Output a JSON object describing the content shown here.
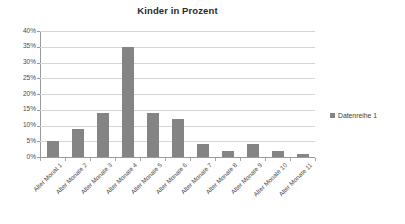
{
  "chart_data": {
    "type": "bar",
    "title": "Kinder in Prozent",
    "xlabel": "",
    "ylabel": "",
    "ylim": [
      0,
      40
    ],
    "ytick_step": 5,
    "ytick_labels": [
      "40%",
      "35%",
      "30%",
      "25%",
      "20%",
      "15%",
      "10%",
      "5%",
      "0%"
    ],
    "ytick_values": [
      40,
      35,
      30,
      25,
      20,
      15,
      10,
      5,
      0
    ],
    "grid": true,
    "legend_position": "right",
    "categories": [
      "Alter Monat 1",
      "Alter Monate 2",
      "Alter Monate 3",
      "Alter Monate 4",
      "Alter Monate 5",
      "Alter Monate 6",
      "Alter Monate 7",
      "Alter Monate 8",
      "Alter Monate 9",
      "Alter Monate 10",
      "Alter Monate 11"
    ],
    "series": [
      {
        "name": "Datenreihe 1",
        "color": "#848484",
        "values": [
          5,
          9,
          14,
          35,
          14,
          12,
          4,
          2,
          4,
          2,
          1
        ]
      }
    ]
  },
  "legend": {
    "entries": [
      {
        "label": "Datenreihe 1",
        "color": "#848484"
      }
    ]
  },
  "colors": {
    "bar": "#848484",
    "gridline": "#d6d6d6",
    "axis": "#9a9a9a",
    "text": "#3b3b3b",
    "background": "#ffffff"
  }
}
